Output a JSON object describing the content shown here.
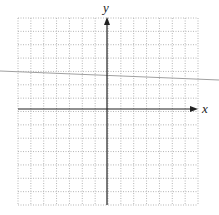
{
  "figure": {
    "type": "coordinate-plane",
    "axes": {
      "x_label": "x",
      "y_label": "y"
    },
    "grid": {
      "columns": 14,
      "rows": 14,
      "style": "dotted",
      "origin_column": 7,
      "origin_row": 7
    },
    "line": {
      "description": "light gray straight line crossing the plane with slight negative slope",
      "color": "#a0a0a0"
    },
    "colors": {
      "grid": "#b5b5b5",
      "axes": "#222222",
      "line": "#a0a0a0",
      "background": "#ffffff"
    }
  }
}
